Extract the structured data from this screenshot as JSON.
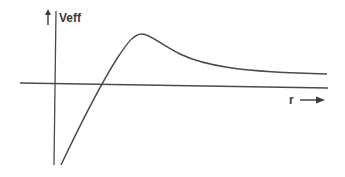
{
  "diagram": {
    "y_label": "Veff",
    "x_label": "r",
    "line_color": "#4a4a4a",
    "curve": {
      "description": "Effective potential vs r: rises from large negative values, crosses zero, peaks, then decays toward a small positive asymptote",
      "path": "M61,165 C80,125 100,85 118,57 C128,42 134,34 142,34 C150,34 160,44 180,54 C205,66 240,72 327,74"
    }
  }
}
